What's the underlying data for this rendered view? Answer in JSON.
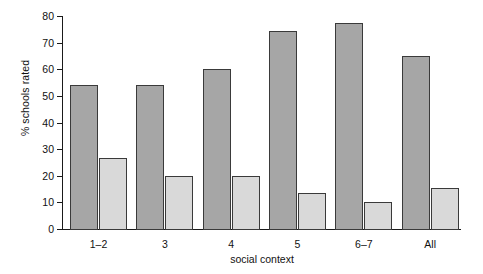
{
  "chart_data": {
    "type": "bar",
    "title": "",
    "xlabel": "social context",
    "ylabel": "% schools rated",
    "categories": [
      "1–2",
      "3",
      "4",
      "5",
      "6–7",
      "All"
    ],
    "series": [
      {
        "name": "series-1",
        "color": "#a6a6a6",
        "values": [
          54,
          54,
          60,
          74.5,
          77.5,
          65
        ]
      },
      {
        "name": "series-2",
        "color": "#d9d9d9",
        "values": [
          26.5,
          20,
          20,
          13.5,
          10,
          15.5
        ]
      }
    ],
    "ylim": [
      0,
      80
    ],
    "yticks": [
      0,
      10,
      20,
      30,
      40,
      50,
      60,
      70,
      80
    ],
    "ytick_labels": [
      "0",
      "10",
      "20",
      "30",
      "40",
      "50",
      "60",
      "70",
      "80"
    ],
    "grid": false,
    "legend": "none",
    "axis_color": "#1a1a1a",
    "background": "#ffffff"
  }
}
